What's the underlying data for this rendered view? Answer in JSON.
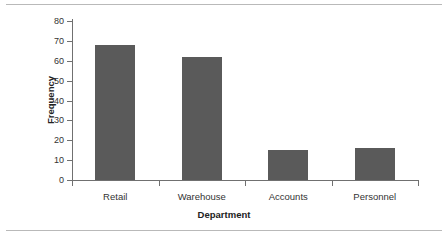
{
  "chart_data": {
    "type": "bar",
    "title": "",
    "categories": [
      "Retail",
      "Warehouse",
      "Accounts",
      "Personnel"
    ],
    "values": [
      68,
      62,
      15,
      16
    ],
    "xlabel": "Department",
    "ylabel": "Frequency",
    "ylim": [
      0,
      80
    ],
    "yticks": [
      0,
      10,
      20,
      30,
      40,
      50,
      60,
      70,
      80
    ],
    "ytick_labels": [
      "0",
      "10",
      "20",
      "30",
      "40",
      "50",
      "60",
      "70",
      "80"
    ],
    "grid": false,
    "legend": null,
    "bar_color": "#5a5a5a",
    "axis_color": "#707070",
    "text_color": "#333333"
  },
  "figure": {
    "background": "#ffffff",
    "rule_color": "#b9b9b9"
  }
}
